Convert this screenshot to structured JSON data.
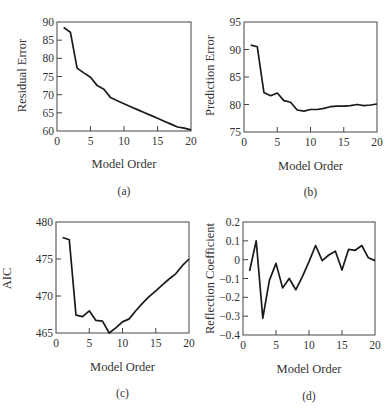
{
  "chart_data": [
    {
      "id": "a",
      "type": "line",
      "title": "",
      "caption": "(a)",
      "xlabel": "Model Order",
      "ylabel": "Residual Error",
      "xlim": [
        0,
        20
      ],
      "ylim": [
        60,
        90
      ],
      "xticks": [
        0,
        5,
        10,
        15,
        20
      ],
      "yticks": [
        60,
        65,
        70,
        75,
        80,
        85,
        90
      ],
      "grid": false,
      "x": [
        1,
        2,
        3,
        4,
        5,
        6,
        7,
        8,
        9,
        10,
        11,
        12,
        13,
        14,
        15,
        16,
        17,
        18,
        19,
        20
      ],
      "series": [
        {
          "name": "Residual Error",
          "values": [
            88.5,
            87.2,
            77.3,
            76.0,
            74.8,
            72.5,
            71.5,
            69.2,
            68.3,
            67.5,
            66.7,
            65.9,
            65.1,
            64.3,
            63.5,
            62.7,
            61.9,
            61.1,
            60.8,
            60.3
          ]
        }
      ]
    },
    {
      "id": "b",
      "type": "line",
      "title": "",
      "caption": "(b)",
      "xlabel": "Model Order",
      "ylabel": "Prediction Error",
      "xlim": [
        0,
        20
      ],
      "ylim": [
        75,
        95
      ],
      "xticks": [
        0,
        5,
        10,
        15,
        20
      ],
      "yticks": [
        75,
        80,
        85,
        90,
        95
      ],
      "grid": false,
      "x": [
        1,
        2,
        3,
        4,
        5,
        6,
        7,
        8,
        9,
        10,
        11,
        12,
        13,
        14,
        15,
        16,
        17,
        18,
        19,
        20
      ],
      "series": [
        {
          "name": "Prediction Error",
          "values": [
            90.8,
            90.5,
            82.2,
            81.6,
            82.1,
            80.7,
            80.4,
            79.0,
            78.8,
            79.1,
            79.1,
            79.3,
            79.6,
            79.7,
            79.7,
            79.8,
            80.0,
            79.8,
            79.9,
            80.1
          ]
        }
      ]
    },
    {
      "id": "c",
      "type": "line",
      "title": "",
      "caption": "(c)",
      "xlabel": "Model Order",
      "ylabel": "AIC",
      "xlim": [
        0,
        20
      ],
      "ylim": [
        465,
        480
      ],
      "xticks": [
        0,
        5,
        10,
        15,
        20
      ],
      "yticks": [
        465,
        470,
        475,
        480
      ],
      "grid": false,
      "x": [
        1,
        2,
        3,
        4,
        5,
        6,
        7,
        8,
        9,
        10,
        11,
        12,
        13,
        14,
        15,
        16,
        17,
        18,
        19,
        20
      ],
      "series": [
        {
          "name": "AIC",
          "values": [
            477.9,
            477.6,
            467.4,
            467.2,
            468.0,
            466.7,
            466.6,
            465.0,
            465.7,
            466.5,
            466.9,
            468.0,
            469.0,
            469.9,
            470.7,
            471.5,
            472.3,
            473.0,
            474.1,
            475.0
          ]
        }
      ]
    },
    {
      "id": "d",
      "type": "line",
      "title": "",
      "caption": "(d)",
      "xlabel": "Model Order",
      "ylabel": "Reflection Coefficient",
      "xlim": [
        0,
        20
      ],
      "ylim": [
        -0.4,
        0.2
      ],
      "xticks": [
        0,
        5,
        10,
        15,
        20
      ],
      "yticks": [
        -0.4,
        -0.3,
        -0.2,
        -0.1,
        0,
        0.1,
        0.2
      ],
      "ytick_labels": [
        "−0.4",
        "−0.3",
        "−0.2",
        "−0.1",
        "0",
        "0.1",
        "0.2"
      ],
      "grid": false,
      "x": [
        1,
        2,
        3,
        4,
        5,
        6,
        7,
        8,
        9,
        10,
        11,
        12,
        13,
        14,
        15,
        16,
        17,
        18,
        19,
        20
      ],
      "series": [
        {
          "name": "Reflection Coefficient",
          "values": [
            -0.06,
            0.1,
            -0.31,
            -0.11,
            -0.02,
            -0.15,
            -0.1,
            -0.16,
            -0.09,
            -0.01,
            0.075,
            -0.005,
            0.025,
            0.045,
            -0.055,
            0.055,
            0.05,
            0.075,
            0.01,
            -0.005
          ]
        }
      ]
    }
  ],
  "panels": [
    {
      "xlabel": "Model Order",
      "ylabel": "Residual Error",
      "caption": "(a)"
    },
    {
      "xlabel": "Model Order",
      "ylabel": "Prediction Error",
      "caption": "(b)"
    },
    {
      "xlabel": "Model Order",
      "ylabel": "AIC",
      "caption": "(c)"
    },
    {
      "xlabel": "Model Order",
      "ylabel": "Reflection Coefficient",
      "caption": "(d)"
    }
  ]
}
